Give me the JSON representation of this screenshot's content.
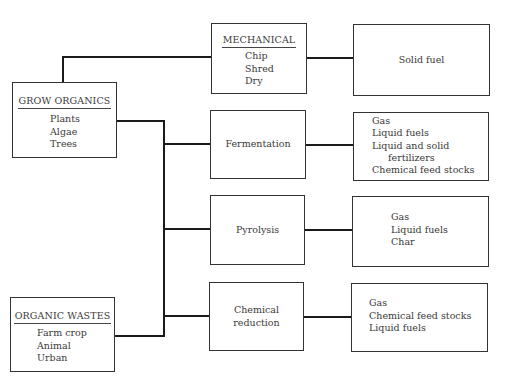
{
  "sources": {
    "grow": {
      "title": "GROW ORGANICS",
      "items": [
        "Plants",
        "Algae",
        "Trees"
      ]
    },
    "wastes": {
      "title": "ORGANIC WASTES",
      "items": [
        "Farm crop",
        "Animal",
        "Urban"
      ]
    }
  },
  "processes": {
    "mechanical": {
      "title": "MECHANICAL",
      "items": [
        "Chip",
        "Shred",
        "Dry"
      ]
    },
    "fermentation": {
      "label": "Fermentation"
    },
    "pyrolysis": {
      "label": "Pyrolysis"
    },
    "chemical": {
      "label_line1": "Chemical",
      "label_line2": "reduction"
    }
  },
  "outputs": {
    "mechanical": {
      "label": "Solid fuel"
    },
    "fermentation": {
      "items": [
        "Gas",
        "Liquid fuels",
        "Liquid and solid",
        "fertilizers",
        "Chemical feed stocks"
      ]
    },
    "pyrolysis": {
      "items": [
        "Gas",
        "Liquid fuels",
        "Char"
      ]
    },
    "chemical": {
      "items": [
        "Gas",
        "Chemical feed stocks",
        "Liquid fuels"
      ]
    }
  }
}
